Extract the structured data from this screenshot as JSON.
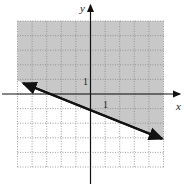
{
  "chart_data": {
    "type": "line",
    "title": "",
    "xlabel": "x",
    "ylabel": "y",
    "xlim": [
      -5,
      5
    ],
    "ylim": [
      -5,
      5
    ],
    "grid": true,
    "tick_labels": {
      "x": "1",
      "y": "1"
    },
    "series": [
      {
        "name": "boundary line",
        "style": "solid",
        "x": [
          -5,
          5
        ],
        "y": [
          0.9,
          -3.1
        ],
        "arrows": "both"
      }
    ],
    "shaded_region": "above line (y > -0.4x - 1)",
    "colors": {
      "shade": "#c8c8c8",
      "grid": "#888888",
      "axes": "#111111"
    }
  },
  "labels": {
    "x_axis": "x",
    "y_axis": "y",
    "x_tick": "1",
    "y_tick": "1"
  }
}
